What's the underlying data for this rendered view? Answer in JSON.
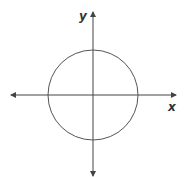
{
  "diagram": {
    "type": "coordinate-plane-with-circle",
    "axes": {
      "x_label": "x",
      "y_label": "y",
      "color": "#444444"
    },
    "circle": {
      "center": [
        0,
        0
      ],
      "stroke": "#555555"
    },
    "background": "#ffffff"
  }
}
